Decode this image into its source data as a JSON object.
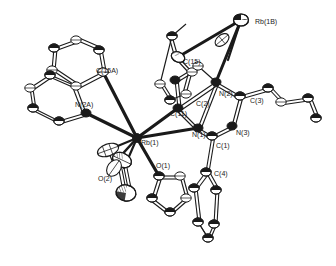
{
  "figure": {
    "kind": "ortep-crystal-structure-diagram",
    "background_color": "#ffffff",
    "line_color": "#1a1a1a",
    "fill_light": "#ffffff",
    "fill_dark": "#1a1a1a",
    "width": 336,
    "height": 266
  },
  "labels": [
    {
      "id": "rb1b",
      "text": "Rb(1B)",
      "x": 255,
      "y": 24
    },
    {
      "id": "c15",
      "text": "C(15)",
      "x": 183,
      "y": 64
    },
    {
      "id": "c15a",
      "text": "C(15A)",
      "x": 96,
      "y": 73
    },
    {
      "id": "n2",
      "text": "N(2)",
      "x": 219,
      "y": 96
    },
    {
      "id": "c3",
      "text": "C(3)",
      "x": 250,
      "y": 103
    },
    {
      "id": "c2",
      "text": "C(2)",
      "x": 196,
      "y": 106
    },
    {
      "id": "c11",
      "text": "C(11)",
      "x": 170,
      "y": 116
    },
    {
      "id": "n2a",
      "text": "N(2A)",
      "x": 75,
      "y": 107
    },
    {
      "id": "n1",
      "text": "N(1)",
      "x": 192,
      "y": 137
    },
    {
      "id": "n3",
      "text": "N(3)",
      "x": 236,
      "y": 135
    },
    {
      "id": "rb1",
      "text": "Rb(1)",
      "x": 141,
      "y": 145
    },
    {
      "id": "c1",
      "text": "C(1)",
      "x": 216,
      "y": 148
    },
    {
      "id": "o1",
      "text": "O(1)",
      "x": 156,
      "y": 168
    },
    {
      "id": "c4",
      "text": "C(4)",
      "x": 214,
      "y": 176
    },
    {
      "id": "o2",
      "text": "O(2)",
      "x": 98,
      "y": 181
    }
  ],
  "atoms": {
    "metal_centers": [
      "Rb(1)",
      "Rb(1B)"
    ],
    "nitrogen_sites": [
      "N(1)",
      "N(2)",
      "N(3)",
      "N(2A)"
    ],
    "oxygen_sites": [
      "O(1)",
      "O(2)"
    ],
    "carbon_sites": [
      "C(1)",
      "C(2)",
      "C(3)",
      "C(4)",
      "C(11)",
      "C(15)",
      "C(15A)"
    ]
  }
}
